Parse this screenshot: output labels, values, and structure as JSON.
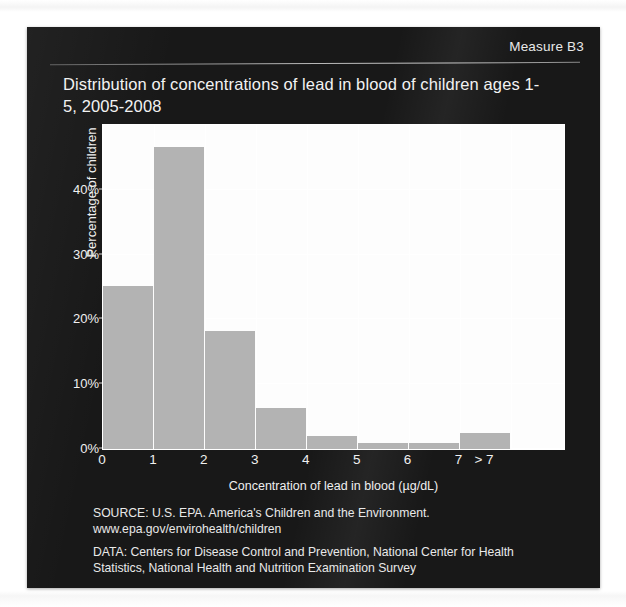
{
  "slide": {
    "measure_label": "Measure B3",
    "title": "Distribution of concentrations of lead in blood of children ages 1-5, 2005-2008",
    "source_note_line1": "SOURCE: U.S. EPA. America's Children and the Environment.",
    "source_note_line2": "www.epa.gov/envirohealth/children",
    "data_note_line1": "DATA: Centers for Disease Control and Prevention, National Center for Health",
    "data_note_line2": "Statistics, National Health and Nutrition Examination Survey",
    "colors": {
      "panel_background": "#181818",
      "plot_background": "#fdfdfd",
      "bar_fill": "#b3b3b3",
      "gridline": "#ffffff",
      "text": "#f0f0f0"
    }
  },
  "chart_data": {
    "type": "bar",
    "title": "Distribution of concentrations of lead in blood of children ages 1-5, 2005-2008",
    "xlabel": "Concentration of lead in blood (µg/dL)",
    "ylabel": "Percentage of children",
    "categories": [
      "0-1",
      "1-2",
      "2-3",
      "3-4",
      "4-5",
      "5-6",
      "6-7",
      "> 7"
    ],
    "values": [
      25.1,
      46.6,
      18.2,
      6.3,
      2.0,
      1.0,
      1.0,
      2.5
    ],
    "ylim": [
      0,
      50
    ],
    "ytick_labels": [
      "0%",
      "10%",
      "20%",
      "30%",
      "40%"
    ],
    "ytick_values": [
      0,
      10,
      20,
      30,
      40
    ],
    "xtick_labels": [
      "0",
      "1",
      "2",
      "3",
      "4",
      "5",
      "6",
      "7",
      "> 7"
    ],
    "grid": true,
    "legend": "none"
  }
}
